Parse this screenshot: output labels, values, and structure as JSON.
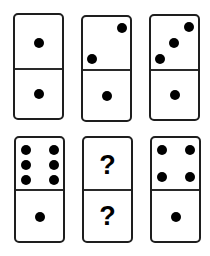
{
  "puzzle": {
    "colors": {
      "border": "#1e1e1e",
      "pip": "#000000",
      "face": "#ffffff"
    },
    "dominoes": [
      {
        "id": "domino-1",
        "left": 13,
        "top": 13,
        "top_value": 1,
        "bottom_value": 1,
        "divider_y": 53,
        "pips": [
          [
            24,
            28
          ],
          [
            24,
            79
          ]
        ]
      },
      {
        "id": "domino-2",
        "left": 81,
        "top": 15,
        "top_value": 2,
        "bottom_value": 1,
        "divider_y": 52,
        "pips": [
          [
            39,
            11
          ],
          [
            9,
            42
          ],
          [
            24,
            79
          ]
        ]
      },
      {
        "id": "domino-3",
        "left": 149,
        "top": 14,
        "top_value": 3,
        "bottom_value": 1,
        "divider_y": 53,
        "pips": [
          [
            38,
            11
          ],
          [
            23,
            27
          ],
          [
            9,
            43
          ],
          [
            24,
            79
          ]
        ]
      },
      {
        "id": "domino-4",
        "left": 14,
        "top": 136,
        "top_value": 6,
        "bottom_value": 1,
        "divider_y": 51,
        "pips": [
          [
            10,
            12
          ],
          [
            38,
            12
          ],
          [
            10,
            27
          ],
          [
            38,
            27
          ],
          [
            10,
            42
          ],
          [
            38,
            42
          ],
          [
            24,
            79
          ]
        ]
      },
      {
        "id": "domino-5",
        "left": 82,
        "top": 136,
        "top_value": "?",
        "bottom_value": "?",
        "divider_y": 51,
        "question_marks": [
          "?",
          "?"
        ],
        "pips": []
      },
      {
        "id": "domino-6",
        "left": 150,
        "top": 136,
        "top_value": 4,
        "bottom_value": 1,
        "divider_y": 51,
        "pips": [
          [
            10,
            12
          ],
          [
            38,
            12
          ],
          [
            10,
            39
          ],
          [
            38,
            39
          ],
          [
            24,
            79
          ]
        ]
      }
    ]
  }
}
